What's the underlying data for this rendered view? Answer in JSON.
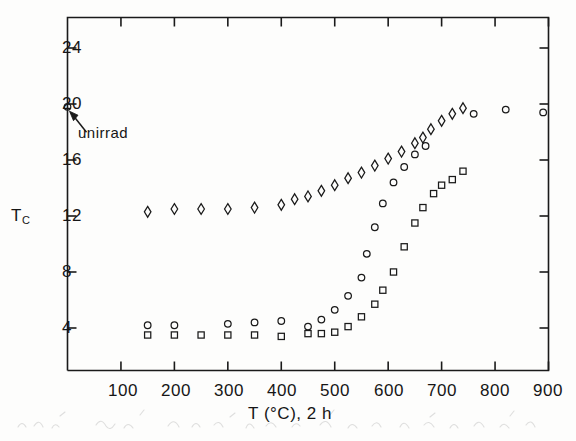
{
  "figure": {
    "background_color": "#fdfdfc",
    "ink_color": "#1a1a1a"
  },
  "axes": {
    "x_title": "T (°C), 2 h",
    "y_title_main": "T",
    "y_title_sub": "C",
    "x_tick_labels": [
      "100",
      "200",
      "300",
      "400",
      "500",
      "600",
      "700",
      "800",
      "900"
    ],
    "y_tick_labels": [
      "4",
      "8",
      "12",
      "16",
      "20",
      "24"
    ]
  },
  "annotations": [
    {
      "name": "unirrad-annotation",
      "text": "unirrad",
      "points_to_x": 0,
      "points_to_y": 19.7
    }
  ],
  "chart_data": {
    "type": "scatter",
    "title": "",
    "xlabel": "T (°C), 2 h",
    "ylabel": "Tc",
    "xlim": [
      0,
      900
    ],
    "ylim": [
      0,
      26
    ],
    "xticks": [
      100,
      200,
      300,
      400,
      500,
      600,
      700,
      800,
      900
    ],
    "yticks": [
      4,
      8,
      12,
      16,
      20,
      24
    ],
    "grid": false,
    "legend": "none",
    "annotations": [
      {
        "text": "unirrad",
        "x": 0,
        "y": 19.7,
        "arrow_to": [
          0,
          19.8
        ]
      }
    ],
    "series": [
      {
        "name": "unirrad-reference",
        "marker": "circle",
        "points": [
          {
            "x": 0,
            "y": 19.8
          }
        ]
      },
      {
        "name": "diamond-series",
        "marker": "diamond",
        "points": [
          {
            "x": 150,
            "y": 12.3
          },
          {
            "x": 200,
            "y": 12.5
          },
          {
            "x": 250,
            "y": 12.5
          },
          {
            "x": 300,
            "y": 12.5
          },
          {
            "x": 350,
            "y": 12.6
          },
          {
            "x": 400,
            "y": 12.8
          },
          {
            "x": 425,
            "y": 13.2
          },
          {
            "x": 450,
            "y": 13.4
          },
          {
            "x": 475,
            "y": 13.8
          },
          {
            "x": 500,
            "y": 14.2
          },
          {
            "x": 525,
            "y": 14.7
          },
          {
            "x": 550,
            "y": 15.1
          },
          {
            "x": 575,
            "y": 15.6
          },
          {
            "x": 600,
            "y": 16.1
          },
          {
            "x": 625,
            "y": 16.6
          },
          {
            "x": 650,
            "y": 17.2
          },
          {
            "x": 665,
            "y": 17.6
          },
          {
            "x": 680,
            "y": 18.2
          },
          {
            "x": 700,
            "y": 18.8
          },
          {
            "x": 720,
            "y": 19.3
          },
          {
            "x": 740,
            "y": 19.7
          }
        ]
      },
      {
        "name": "circle-series",
        "marker": "circle",
        "points": [
          {
            "x": 150,
            "y": 4.2
          },
          {
            "x": 200,
            "y": 4.2
          },
          {
            "x": 300,
            "y": 4.3
          },
          {
            "x": 350,
            "y": 4.4
          },
          {
            "x": 400,
            "y": 4.5
          },
          {
            "x": 450,
            "y": 4.1
          },
          {
            "x": 475,
            "y": 4.6
          },
          {
            "x": 500,
            "y": 5.3
          },
          {
            "x": 525,
            "y": 6.3
          },
          {
            "x": 550,
            "y": 7.6
          },
          {
            "x": 560,
            "y": 9.3
          },
          {
            "x": 575,
            "y": 11.2
          },
          {
            "x": 590,
            "y": 12.9
          },
          {
            "x": 610,
            "y": 14.4
          },
          {
            "x": 630,
            "y": 15.5
          },
          {
            "x": 650,
            "y": 16.4
          },
          {
            "x": 670,
            "y": 17.0
          },
          {
            "x": 760,
            "y": 19.3
          },
          {
            "x": 820,
            "y": 19.6
          },
          {
            "x": 890,
            "y": 19.4
          }
        ]
      },
      {
        "name": "square-series",
        "marker": "square",
        "points": [
          {
            "x": 150,
            "y": 3.5
          },
          {
            "x": 200,
            "y": 3.5
          },
          {
            "x": 250,
            "y": 3.5
          },
          {
            "x": 300,
            "y": 3.5
          },
          {
            "x": 350,
            "y": 3.5
          },
          {
            "x": 400,
            "y": 3.4
          },
          {
            "x": 450,
            "y": 3.6
          },
          {
            "x": 475,
            "y": 3.6
          },
          {
            "x": 500,
            "y": 3.7
          },
          {
            "x": 525,
            "y": 4.1
          },
          {
            "x": 550,
            "y": 4.8
          },
          {
            "x": 575,
            "y": 5.7
          },
          {
            "x": 590,
            "y": 6.7
          },
          {
            "x": 610,
            "y": 8.0
          },
          {
            "x": 630,
            "y": 9.8
          },
          {
            "x": 650,
            "y": 11.5
          },
          {
            "x": 665,
            "y": 12.6
          },
          {
            "x": 685,
            "y": 13.6
          },
          {
            "x": 700,
            "y": 14.2
          },
          {
            "x": 720,
            "y": 14.6
          },
          {
            "x": 740,
            "y": 15.2
          }
        ]
      }
    ]
  }
}
